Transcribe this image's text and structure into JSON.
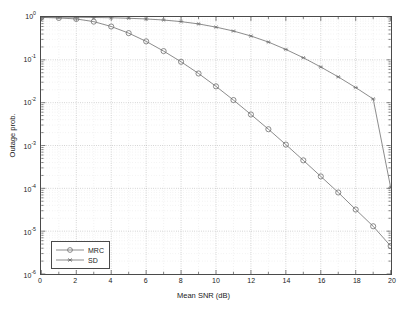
{
  "chart_data": {
    "type": "line",
    "title": "",
    "xlabel": "Mean SNR (dB)",
    "ylabel": "Outage prob.",
    "xlim": [
      0,
      20
    ],
    "ylim": [
      1e-06,
      1
    ],
    "yscale": "log",
    "grid": true,
    "legend_position": "lower left",
    "x": [
      0,
      1,
      2,
      3,
      4,
      5,
      6,
      7,
      8,
      9,
      10,
      11,
      12,
      13,
      14,
      15,
      16,
      17,
      18,
      19,
      20
    ],
    "xticks": [
      0,
      2,
      4,
      6,
      8,
      10,
      12,
      14,
      16,
      18,
      20
    ],
    "xtick_labels": [
      "0",
      "2",
      "4",
      "6",
      "8",
      "10",
      "12",
      "14",
      "16",
      "18",
      "20"
    ],
    "yticks": [
      1,
      0.1,
      0.01,
      0.001,
      0.0001,
      1e-05,
      1e-06
    ],
    "ytick_labels": [
      "10",
      "10",
      "10",
      "10",
      "10",
      "10",
      "10"
    ],
    "ytick_exponents": [
      "0",
      "-1",
      "-2",
      "-3",
      "-4",
      "-5",
      "-6"
    ],
    "series": [
      {
        "name": "MRC",
        "marker": "circle",
        "color": "#6e6e6e",
        "values": [
          0.98,
          0.95,
          0.9,
          0.78,
          0.6,
          0.42,
          0.27,
          0.16,
          0.09,
          0.048,
          0.024,
          0.0115,
          0.0053,
          0.0024,
          0.00105,
          0.00045,
          0.00019,
          8e-05,
          3.2e-05,
          1.3e-05,
          4.5e-06
        ]
      },
      {
        "name": "SD",
        "marker": "asterisk",
        "color": "#6e6e6e",
        "values": [
          0.995,
          0.99,
          0.985,
          0.975,
          0.96,
          0.935,
          0.9,
          0.85,
          0.78,
          0.69,
          0.58,
          0.47,
          0.36,
          0.26,
          0.175,
          0.112,
          0.068,
          0.04,
          0.0225,
          0.0122,
          0.000105
        ]
      }
    ]
  },
  "legend": {
    "items": [
      {
        "label": "MRC",
        "marker": "circle"
      },
      {
        "label": "SD",
        "marker": "asterisk"
      }
    ]
  }
}
